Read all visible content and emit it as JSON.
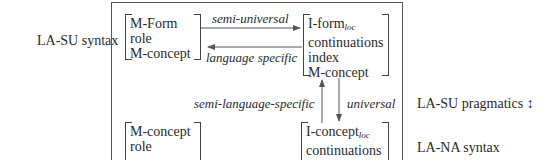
{
  "left_labels": {
    "la_su_syntax": "LA-SU syntax"
  },
  "right_labels": {
    "la_su_pragmatics": "LA-SU pragmatics",
    "la_su_pragmatics_symbol": "↕",
    "la_na_syntax": "LA-NA syntax"
  },
  "boxes": {
    "top_left": {
      "rows": [
        "M-Form",
        "role",
        "M-concept"
      ]
    },
    "top_right": {
      "row0_main": "I-form",
      "row0_sub": "loc",
      "rows": [
        "continuations",
        "index",
        "M-concept"
      ]
    },
    "bottom_left": {
      "rows": [
        "M-concept",
        "role"
      ]
    },
    "bottom_right": {
      "row0_main": "I-concept",
      "row0_sub": "loc",
      "rows": [
        "continuations"
      ]
    }
  },
  "arrows": {
    "semi_universal": "semi-universal",
    "language_specific": "language specific",
    "semi_language_specific": "semi-language-specific",
    "universal": "universal"
  },
  "colors": {
    "line": "#555555",
    "text": "#2a2a2a",
    "background": "#ffffff"
  }
}
